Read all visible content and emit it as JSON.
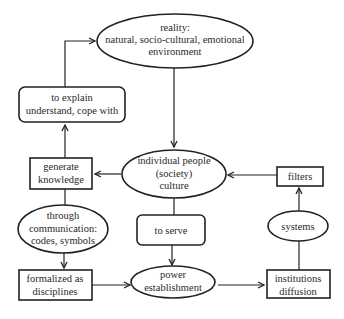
{
  "diagram": {
    "type": "flowchart",
    "nodes": {
      "reality": {
        "shape": "ellipse",
        "lines": [
          "reality:",
          "natural, socio-cultural, emotional",
          "environment"
        ]
      },
      "explain": {
        "shape": "rounded-rectangle",
        "lines": [
          "to explain",
          "understand, cope with"
        ]
      },
      "generate": {
        "shape": "rectangle",
        "lines": [
          "generate",
          "knowledge"
        ]
      },
      "individual": {
        "shape": "ellipse",
        "lines": [
          "individual people",
          "(society)",
          "culture"
        ]
      },
      "filters": {
        "shape": "rectangle",
        "lines": [
          "filters"
        ]
      },
      "communication": {
        "shape": "ellipse",
        "lines": [
          "through",
          "communication:",
          "codes, symbols"
        ]
      },
      "serve": {
        "shape": "rounded-rectangle",
        "lines": [
          "to serve"
        ]
      },
      "systems": {
        "shape": "ellipse",
        "lines": [
          "systems"
        ]
      },
      "formalized": {
        "shape": "rectangle",
        "lines": [
          "formalized as",
          "disciplines"
        ]
      },
      "power": {
        "shape": "ellipse",
        "lines": [
          "power",
          "establishment"
        ]
      },
      "institutions": {
        "shape": "rectangle",
        "lines": [
          "institutions",
          "diffusion"
        ]
      }
    },
    "edges": [
      {
        "from": "reality",
        "to": "individual",
        "arrow": true
      },
      {
        "from": "individual",
        "to": "generate",
        "arrow": true
      },
      {
        "from": "generate",
        "to": "explain",
        "arrow": true
      },
      {
        "from": "explain",
        "to": "reality",
        "arrow": true
      },
      {
        "from": "generate",
        "to": "communication",
        "arrow": false
      },
      {
        "from": "communication",
        "to": "formalized",
        "arrow": true
      },
      {
        "from": "formalized",
        "to": "power",
        "arrow": true
      },
      {
        "from": "individual",
        "to": "serve",
        "arrow": false
      },
      {
        "from": "serve",
        "to": "power",
        "arrow": true
      },
      {
        "from": "power",
        "to": "institutions",
        "arrow": true
      },
      {
        "from": "institutions",
        "to": "systems",
        "arrow": false
      },
      {
        "from": "systems",
        "to": "filters",
        "arrow": true
      },
      {
        "from": "filters",
        "to": "individual",
        "arrow": true
      }
    ]
  }
}
